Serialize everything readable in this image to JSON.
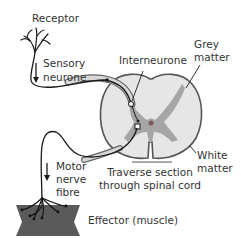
{
  "labels": {
    "receptor": "Receptor",
    "sensory_line1": "Sensory",
    "sensory_line2": "neurone",
    "interneurone": "Interneurone",
    "grey_line1": "Grey",
    "grey_line2": "matter",
    "white_line1": "White",
    "white_line2": "matter",
    "section_line1": "Traverse section",
    "section_line2": "through spinal cord",
    "motor_line1": "Motor",
    "motor_line2": "nerve",
    "motor_line3": "fibre",
    "effector": "Effector (muscle)"
  },
  "colors": {
    "cord_fill": "#e6e6e6",
    "grey_matter": "#a6a6a6",
    "outline": "#555555",
    "nerve": "#1a1a1a",
    "muscle": "#5a5a5a",
    "text": "#333333"
  }
}
